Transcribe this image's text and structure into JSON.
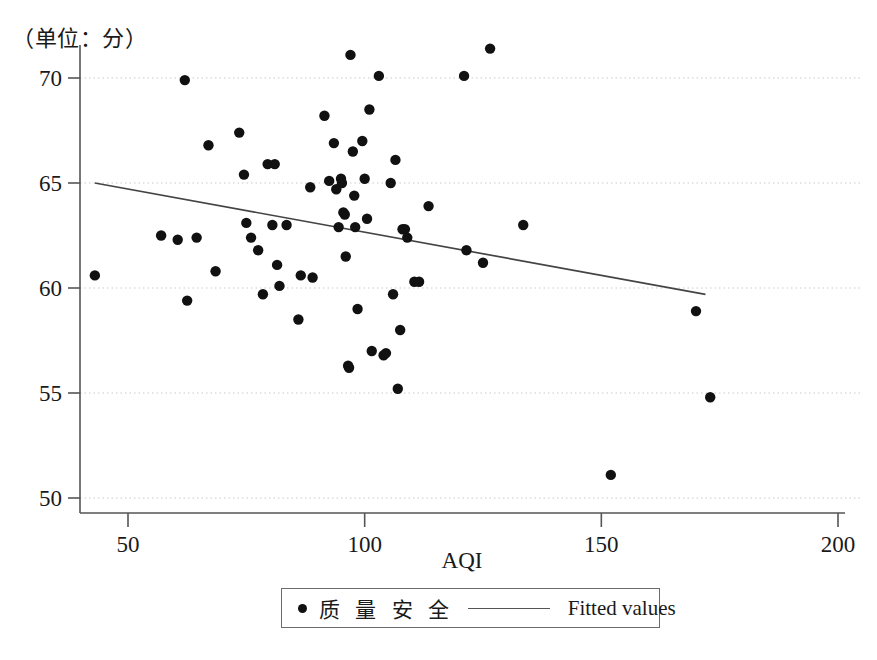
{
  "figure": {
    "unit_label": "（单位：分）",
    "background_color": "#ffffff",
    "marker_color": "#111111",
    "fit_line_color": "#444444",
    "grid_color": "#c9c9c9",
    "axis_color": "#555555"
  },
  "legend": {
    "scatter_label": "质 量 安 全",
    "line_label": "Fitted values",
    "marker_icon": "filled-circle",
    "line_icon": "solid-line"
  },
  "chart_data": {
    "type": "scatter",
    "title": "",
    "subtitle": "",
    "xlabel": "AQI",
    "ylabel": "",
    "unit_note": "（单位：分）",
    "xlim": [
      43,
      200
    ],
    "ylim": [
      49,
      72
    ],
    "xticks": [
      50,
      100,
      150,
      200
    ],
    "yticks": [
      50,
      55,
      60,
      65,
      70
    ],
    "xtick_labels": [
      "50",
      "100",
      "150",
      "200"
    ],
    "ytick_labels": [
      "50",
      "55",
      "60",
      "65",
      "70"
    ],
    "grid": "horizontal-dotted",
    "legend_position": "bottom-center",
    "series": [
      {
        "name": "质 量 安 全",
        "type": "scatter",
        "marker": "filled-circle",
        "color": "#111111",
        "points": [
          [
            43.0,
            60.6
          ],
          [
            57.0,
            62.5
          ],
          [
            62.0,
            69.9
          ],
          [
            62.5,
            59.4
          ],
          [
            60.5,
            62.3
          ],
          [
            64.5,
            62.4
          ],
          [
            67.0,
            66.8
          ],
          [
            68.5,
            60.8
          ],
          [
            73.5,
            67.4
          ],
          [
            74.5,
            65.4
          ],
          [
            75.0,
            63.1
          ],
          [
            76.0,
            62.4
          ],
          [
            77.5,
            61.8
          ],
          [
            78.5,
            59.7
          ],
          [
            79.5,
            65.9
          ],
          [
            81.0,
            65.9
          ],
          [
            80.5,
            63.0
          ],
          [
            81.5,
            61.1
          ],
          [
            82.0,
            60.1
          ],
          [
            83.5,
            63.0
          ],
          [
            86.0,
            58.5
          ],
          [
            86.5,
            60.6
          ],
          [
            88.5,
            64.8
          ],
          [
            89.0,
            60.5
          ],
          [
            91.5,
            68.2
          ],
          [
            92.5,
            65.1
          ],
          [
            93.5,
            66.9
          ],
          [
            94.0,
            64.7
          ],
          [
            94.5,
            62.9
          ],
          [
            95.0,
            65.2
          ],
          [
            95.2,
            65.0
          ],
          [
            95.5,
            63.6
          ],
          [
            95.8,
            63.5
          ],
          [
            96.0,
            61.5
          ],
          [
            96.5,
            56.3
          ],
          [
            96.7,
            56.2
          ],
          [
            97.0,
            71.1
          ],
          [
            97.5,
            66.5
          ],
          [
            97.8,
            64.4
          ],
          [
            98.0,
            62.9
          ],
          [
            98.5,
            59.0
          ],
          [
            99.5,
            67.0
          ],
          [
            100.0,
            65.2
          ],
          [
            100.5,
            63.3
          ],
          [
            101.0,
            68.5
          ],
          [
            101.5,
            57.0
          ],
          [
            103.0,
            70.1
          ],
          [
            104.0,
            56.8
          ],
          [
            104.5,
            56.9
          ],
          [
            105.5,
            65.0
          ],
          [
            106.0,
            59.7
          ],
          [
            106.5,
            66.1
          ],
          [
            107.0,
            55.2
          ],
          [
            107.5,
            58.0
          ],
          [
            108.0,
            62.8
          ],
          [
            108.5,
            62.8
          ],
          [
            109.0,
            62.4
          ],
          [
            110.5,
            60.3
          ],
          [
            111.5,
            60.3
          ],
          [
            113.5,
            63.9
          ],
          [
            121.0,
            70.1
          ],
          [
            121.5,
            61.8
          ],
          [
            125.0,
            61.2
          ],
          [
            126.5,
            71.4
          ],
          [
            133.5,
            63.0
          ],
          [
            152.0,
            51.1
          ],
          [
            170.0,
            58.9
          ],
          [
            173.0,
            54.8
          ]
        ]
      },
      {
        "name": "Fitted values",
        "type": "line",
        "color": "#444444",
        "endpoints": [
          [
            43.0,
            65.0
          ],
          [
            172.0,
            59.7
          ]
        ],
        "slope": -0.0411,
        "intercept": 66.77
      }
    ]
  }
}
